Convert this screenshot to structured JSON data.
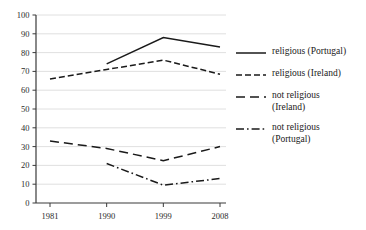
{
  "chart_data": {
    "type": "line",
    "title": "",
    "subtitle": "",
    "xlabel": "",
    "ylabel": "",
    "x": [
      "1981",
      "1990",
      "1999",
      "2008"
    ],
    "categories": [
      "1981",
      "1990",
      "1999",
      "2008"
    ],
    "xlim": [
      1981,
      2008
    ],
    "ylim": [
      0,
      100
    ],
    "yticks": [
      0,
      10,
      20,
      30,
      40,
      50,
      60,
      70,
      80,
      90,
      100
    ],
    "xticks": [
      "1981",
      "1990",
      "1999",
      "2008"
    ],
    "grid": "horizontal",
    "legend_position": "right",
    "series": [
      {
        "name": "religious (Portugal)",
        "linestyle": "solid",
        "color": "#1a1a1a",
        "x": [
          "1990",
          "1999",
          "2008"
        ],
        "values": [
          74,
          88,
          83
        ]
      },
      {
        "name": "religious (Ireland)",
        "linestyle": "short-dash",
        "color": "#1a1a1a",
        "x": [
          "1981",
          "1990",
          "1999",
          "2008"
        ],
        "values": [
          66,
          71,
          76,
          68.5
        ]
      },
      {
        "name": "not religious (Ireland)",
        "linestyle": "long-dash",
        "color": "#1a1a1a",
        "x": [
          "1981",
          "1990",
          "1999",
          "2008"
        ],
        "values": [
          33,
          29,
          22.5,
          30
        ]
      },
      {
        "name": "not religious (Portugal)",
        "linestyle": "dash-dot",
        "color": "#1a1a1a",
        "x": [
          "1990",
          "1999",
          "2008"
        ],
        "values": [
          21,
          9.5,
          13
        ]
      }
    ]
  },
  "axes": {
    "y_tick_labels": [
      "100",
      "90",
      "80",
      "70",
      "60",
      "50",
      "40",
      "30",
      "20",
      "10",
      "0"
    ],
    "x_tick_labels": [
      "1981",
      "1990",
      "1999",
      "2008"
    ]
  },
  "legend": {
    "entries": [
      {
        "label": "religious (Portugal)",
        "style": "solid"
      },
      {
        "label": "religious (Ireland)",
        "style": "short-dash"
      },
      {
        "label": "not religious\n(Ireland)",
        "style": "long-dash"
      },
      {
        "label": "not religious\n(Portugal)",
        "style": "dash-dot"
      }
    ]
  }
}
